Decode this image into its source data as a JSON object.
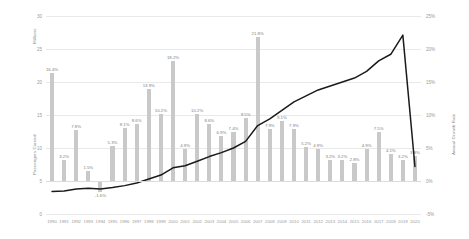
{
  "chart_data": {
    "type": "bar",
    "title": "",
    "subtitle": "",
    "xlabel": "",
    "ylabel": "Passengers Carried",
    "y_unit_label": "Millions",
    "y2label": "Annual Growth Rate",
    "categories": [
      "1990",
      "1991",
      "1992",
      "1993",
      "1994",
      "1995",
      "1996",
      "1997",
      "1998",
      "1999",
      "2000",
      "2001",
      "2002",
      "2003",
      "2004",
      "2005",
      "2006",
      "2007",
      "2008",
      "2009",
      "2010",
      "2011",
      "2012",
      "2013",
      "2014",
      "2015",
      "2016",
      "2017",
      "2018",
      "2019",
      "2020"
    ],
    "ylim": [
      0,
      30
    ],
    "y_ticks": [
      0,
      5,
      10,
      15,
      20,
      25,
      30
    ],
    "y_tick_labels": [
      "0",
      "5",
      "10",
      "15",
      "20",
      "25",
      "30"
    ],
    "y2lim": [
      -5,
      25
    ],
    "y2_ticks": [
      -5,
      0,
      5,
      10,
      15,
      20,
      25
    ],
    "y2_tick_labels": [
      "-5%",
      "0%",
      "5%",
      "10%",
      "15%",
      "20%",
      "25%"
    ],
    "grid": true,
    "legend": "none",
    "series": [
      {
        "name": "Annual Growth Rate",
        "type": "bar",
        "axis": "right",
        "unit": "%",
        "color": "#c9c9c9",
        "values": [
          16.4,
          3.2,
          7.8,
          1.5,
          -1.6,
          5.3,
          8.1,
          8.6,
          13.9,
          10.2,
          18.2,
          4.9,
          10.2,
          8.6,
          6.9,
          7.4,
          9.5,
          21.8,
          7.9,
          9.1,
          7.9,
          5.2,
          4.9,
          3.2,
          3.2,
          2.8,
          4.9,
          7.5,
          4.1,
          3.2,
          3.8
        ],
        "labels": [
          "16.4%",
          "3.2%",
          "7.8%",
          "1.5%",
          "-1.6%",
          "5.3%",
          "8.1%",
          "8.6%",
          "13.9%",
          "10.2%",
          "18.2%",
          "4.9%",
          "10.2%",
          "8.6%",
          "6.9%",
          "7.4%",
          "9.5%",
          "21.8%",
          "7.9%",
          "9.1%",
          "7.9%",
          "5.2%",
          "4.9%",
          "3.2%",
          "3.2%",
          "2.8%",
          "4.9%",
          "7.5%",
          "4.1%",
          "3.2%",
          "3.8%"
        ]
      },
      {
        "name": "Passengers Carried",
        "type": "line",
        "axis": "left",
        "unit": "Millions",
        "color": "#1a1a1a",
        "values": [
          3.4,
          3.5,
          3.8,
          3.9,
          3.8,
          4.0,
          4.3,
          4.7,
          5.3,
          5.9,
          7.0,
          7.3,
          8.0,
          8.7,
          9.3,
          10.0,
          11.0,
          13.4,
          14.4,
          15.7,
          17.0,
          17.9,
          18.8,
          19.4,
          20.0,
          20.6,
          21.6,
          23.2,
          24.2,
          27.1,
          7.2
        ]
      }
    ]
  }
}
